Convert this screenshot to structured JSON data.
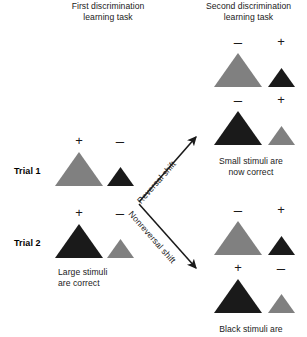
{
  "figure": {
    "headings": {
      "first_task_line1": "First discrimination",
      "first_task_line2": "learning task",
      "second_task_line1": "Second discrimination",
      "second_task_line2": "learning task"
    },
    "trial_labels": {
      "trial1": "Trial 1",
      "trial2": "Trial 2"
    },
    "arrow_labels": {
      "reversal": "Reversal shift",
      "nonreversal": "Nonreversal shift"
    },
    "captions": {
      "first_task_line1": "Large stimuli",
      "first_task_line2": "are correct",
      "reversal_line1": "Small stimuli are",
      "reversal_line2": "now correct",
      "nonreversal_line1": "Black stimuli are"
    },
    "signs": {
      "plus": "+",
      "minus": "–"
    },
    "colors": {
      "gray_stimulus": "#808080",
      "black_stimulus": "#1a1a1a",
      "text": "#1a1a1a",
      "background": "#ffffff"
    },
    "stimuli": {
      "first_task_trial1": [
        {
          "sign": "+",
          "size": "large",
          "color": "gray"
        },
        {
          "sign": "–",
          "size": "small",
          "color": "black"
        }
      ],
      "first_task_trial2": [
        {
          "sign": "+",
          "size": "large",
          "color": "black"
        },
        {
          "sign": "–",
          "size": "small",
          "color": "gray"
        }
      ],
      "reversal_row1": [
        {
          "sign": "–",
          "size": "large",
          "color": "gray"
        },
        {
          "sign": "+",
          "size": "small",
          "color": "black"
        }
      ],
      "reversal_row2": [
        {
          "sign": "–",
          "size": "large",
          "color": "black"
        },
        {
          "sign": "+",
          "size": "small",
          "color": "gray"
        }
      ],
      "nonreversal_row1": [
        {
          "sign": "–",
          "size": "large",
          "color": "gray"
        },
        {
          "sign": "+",
          "size": "small",
          "color": "black"
        }
      ],
      "nonreversal_row2": [
        {
          "sign": "+",
          "size": "large",
          "color": "black"
        },
        {
          "sign": "–",
          "size": "small",
          "color": "gray"
        }
      ]
    }
  }
}
